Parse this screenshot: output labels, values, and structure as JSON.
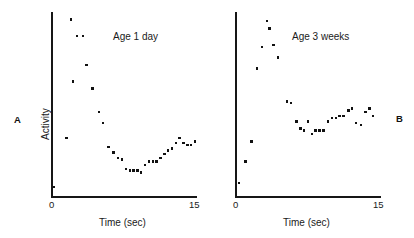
{
  "figure": {
    "panels": [
      {
        "letter": "A",
        "condition_label": "Age 1 day",
        "xlabel": "Time (sec)",
        "ylabel": "Activity",
        "xticks": [
          "0",
          "15"
        ]
      },
      {
        "letter": "B",
        "condition_label": "Age 3 weeks",
        "xlabel": "Time (sec)",
        "ylabel": "",
        "xticks": [
          "0",
          "15"
        ]
      }
    ]
  },
  "chart_data": [
    {
      "type": "scatter",
      "title": "Age 1 day",
      "panel": "A",
      "xlabel": "Time (sec)",
      "ylabel": "Activity",
      "xlim": [
        0,
        15
      ],
      "ylim": [
        0,
        100
      ],
      "grid": false,
      "legend": "none",
      "points": [
        {
          "x": 0.2,
          "y": 5
        },
        {
          "x": 1.5,
          "y": 32
        },
        {
          "x": 2.0,
          "y": 97
        },
        {
          "x": 2.2,
          "y": 63
        },
        {
          "x": 2.6,
          "y": 88
        },
        {
          "x": 3.2,
          "y": 88
        },
        {
          "x": 3.6,
          "y": 72
        },
        {
          "x": 4.2,
          "y": 59
        },
        {
          "x": 4.9,
          "y": 46
        },
        {
          "x": 5.3,
          "y": 40
        },
        {
          "x": 5.9,
          "y": 27
        },
        {
          "x": 6.4,
          "y": 24
        },
        {
          "x": 6.9,
          "y": 21
        },
        {
          "x": 7.3,
          "y": 20
        },
        {
          "x": 7.7,
          "y": 15
        },
        {
          "x": 8.1,
          "y": 14
        },
        {
          "x": 8.5,
          "y": 14
        },
        {
          "x": 8.9,
          "y": 14
        },
        {
          "x": 9.3,
          "y": 13
        },
        {
          "x": 9.7,
          "y": 17
        },
        {
          "x": 10.1,
          "y": 19
        },
        {
          "x": 10.5,
          "y": 19
        },
        {
          "x": 10.9,
          "y": 19
        },
        {
          "x": 11.3,
          "y": 21
        },
        {
          "x": 11.7,
          "y": 23
        },
        {
          "x": 12.1,
          "y": 25
        },
        {
          "x": 12.5,
          "y": 26
        },
        {
          "x": 12.9,
          "y": 29
        },
        {
          "x": 13.3,
          "y": 32
        },
        {
          "x": 13.7,
          "y": 29
        },
        {
          "x": 14.1,
          "y": 28
        },
        {
          "x": 14.5,
          "y": 28
        },
        {
          "x": 14.9,
          "y": 30
        }
      ]
    },
    {
      "type": "scatter",
      "title": "Age 3 weeks",
      "panel": "B",
      "xlabel": "Time (sec)",
      "ylabel": "",
      "xlim": [
        0,
        15
      ],
      "ylim": [
        0,
        100
      ],
      "grid": false,
      "legend": "none",
      "points": [
        {
          "x": 0.3,
          "y": 7
        },
        {
          "x": 1.0,
          "y": 19
        },
        {
          "x": 1.6,
          "y": 30
        },
        {
          "x": 2.2,
          "y": 70
        },
        {
          "x": 2.7,
          "y": 82
        },
        {
          "x": 3.2,
          "y": 96
        },
        {
          "x": 3.5,
          "y": 92
        },
        {
          "x": 3.9,
          "y": 83
        },
        {
          "x": 4.4,
          "y": 76
        },
        {
          "x": 5.3,
          "y": 52
        },
        {
          "x": 5.7,
          "y": 51
        },
        {
          "x": 6.3,
          "y": 41
        },
        {
          "x": 6.7,
          "y": 37
        },
        {
          "x": 7.1,
          "y": 36
        },
        {
          "x": 7.5,
          "y": 41
        },
        {
          "x": 7.9,
          "y": 34
        },
        {
          "x": 8.3,
          "y": 36
        },
        {
          "x": 8.7,
          "y": 36
        },
        {
          "x": 9.1,
          "y": 36
        },
        {
          "x": 9.6,
          "y": 41
        },
        {
          "x": 10.0,
          "y": 43
        },
        {
          "x": 10.4,
          "y": 43
        },
        {
          "x": 10.8,
          "y": 44
        },
        {
          "x": 11.2,
          "y": 44
        },
        {
          "x": 11.7,
          "y": 47
        },
        {
          "x": 12.1,
          "y": 48
        },
        {
          "x": 12.5,
          "y": 40
        },
        {
          "x": 13.0,
          "y": 39
        },
        {
          "x": 13.5,
          "y": 46
        },
        {
          "x": 13.9,
          "y": 48
        },
        {
          "x": 14.3,
          "y": 44
        }
      ]
    }
  ]
}
